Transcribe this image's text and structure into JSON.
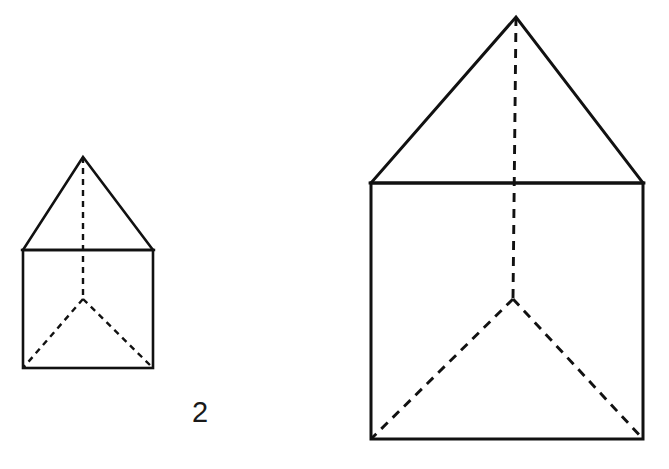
{
  "page": {
    "background_color": "#ffffff",
    "width": 669,
    "height": 469,
    "stroke_color": "#111111",
    "text_color": "#1a1a1a"
  },
  "label": {
    "scale_factor": "2",
    "left": 192,
    "top": 398
  },
  "chart_data": {
    "type": "diagram",
    "title": "",
    "figures": [
      {
        "name": "small-prism",
        "label": "small prism",
        "stroke_width": 2.5,
        "square": {
          "x": 23,
          "y": 250,
          "width": 130,
          "height": 118
        },
        "apex": {
          "x": 83,
          "y": 157
        },
        "junction": {
          "x": 83,
          "y": 299
        },
        "solid_edges": [
          {
            "name": "roof-left-slope",
            "from": [
              23,
              250
            ],
            "to": [
              83,
              157
            ]
          },
          {
            "name": "roof-right-slope",
            "from": [
              83,
              157
            ],
            "to": [
              153,
              250
            ]
          },
          {
            "name": "roof-base-line",
            "from": [
              23,
              250
            ],
            "to": [
              153,
              250
            ]
          },
          {
            "name": "body-left-side",
            "from": [
              23,
              250
            ],
            "to": [
              23,
              368
            ]
          },
          {
            "name": "body-right-side",
            "from": [
              153,
              250
            ],
            "to": [
              153,
              368
            ]
          },
          {
            "name": "body-bottom",
            "from": [
              23,
              368
            ],
            "to": [
              153,
              368
            ]
          }
        ],
        "hidden_edges": [
          {
            "name": "vertical-hidden-edge",
            "from": [
              83,
              157
            ],
            "to": [
              83,
              299
            ]
          },
          {
            "name": "hidden-edge-to-bottom-left",
            "from": [
              83,
              299
            ],
            "to": [
              23,
              368
            ]
          },
          {
            "name": "hidden-edge-to-bottom-right",
            "from": [
              83,
              299
            ],
            "to": [
              153,
              368
            ]
          }
        ],
        "dash_pattern": "6,5"
      },
      {
        "name": "large-prism",
        "label": "large prism",
        "stroke_width": 3,
        "square": {
          "x": 371,
          "y": 183,
          "width": 272,
          "height": 256
        },
        "apex": {
          "x": 516,
          "y": 17
        },
        "junction": {
          "x": 513,
          "y": 299
        },
        "solid_edges": [
          {
            "name": "roof-left-slope",
            "from": [
              371,
              183
            ],
            "to": [
              516,
              17
            ]
          },
          {
            "name": "roof-right-slope",
            "from": [
              516,
              17
            ],
            "to": [
              643,
              183
            ]
          },
          {
            "name": "roof-base-line",
            "from": [
              371,
              183
            ],
            "to": [
              643,
              183
            ]
          },
          {
            "name": "body-left-side",
            "from": [
              371,
              183
            ],
            "to": [
              371,
              439
            ]
          },
          {
            "name": "body-right-side",
            "from": [
              643,
              183
            ],
            "to": [
              643,
              439
            ]
          },
          {
            "name": "body-bottom",
            "from": [
              371,
              439
            ],
            "to": [
              643,
              439
            ]
          }
        ],
        "hidden_edges": [
          {
            "name": "vertical-hidden-edge",
            "from": [
              516,
              17
            ],
            "to": [
              513,
              299
            ]
          },
          {
            "name": "hidden-edge-to-bottom-left",
            "from": [
              513,
              299
            ],
            "to": [
              371,
              439
            ]
          },
          {
            "name": "hidden-edge-to-bottom-right",
            "from": [
              513,
              299
            ],
            "to": [
              643,
              439
            ]
          }
        ],
        "dash_pattern": "9,7"
      }
    ],
    "annotations": [
      {
        "name": "scale-factor",
        "text": "2",
        "x": 202,
        "y": 412
      }
    ]
  }
}
